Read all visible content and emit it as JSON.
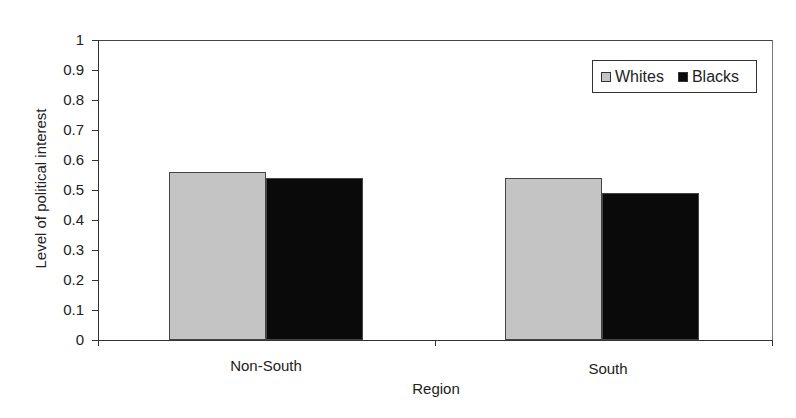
{
  "chart_data": {
    "type": "bar",
    "title": "",
    "xlabel": "Region",
    "ylabel": "Level of political interest",
    "ylim": [
      0,
      1
    ],
    "yticks": [
      "0",
      "0.1",
      "0.2",
      "0.3",
      "0.4",
      "0.5",
      "0.6",
      "0.7",
      "0.8",
      "0.9",
      "1"
    ],
    "categories": [
      "Non-South",
      "South"
    ],
    "series": [
      {
        "name": "Whites",
        "color": "#c4c4c4",
        "values": [
          0.56,
          0.54
        ]
      },
      {
        "name": "Blacks",
        "color": "#0a0a0a",
        "values": [
          0.54,
          0.49
        ]
      }
    ],
    "grid": false,
    "legend_position": "upper right"
  }
}
